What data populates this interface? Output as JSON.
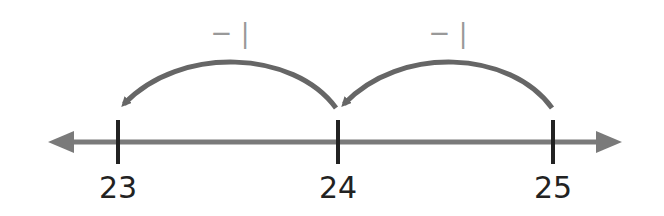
{
  "diagram": {
    "type": "number-line",
    "colors": {
      "line": "#7a7a7a",
      "tick": "#222222",
      "arc": "#666666",
      "jump_label": "#999999",
      "tick_label": "#222222"
    },
    "ticks": [
      {
        "value": "23",
        "x": 118
      },
      {
        "value": "24",
        "x": 338
      },
      {
        "value": "25",
        "x": 553
      }
    ],
    "jumps": [
      {
        "label": "− |",
        "from": "25",
        "to": "24"
      },
      {
        "label": "− |",
        "from": "24",
        "to": "23"
      }
    ]
  }
}
